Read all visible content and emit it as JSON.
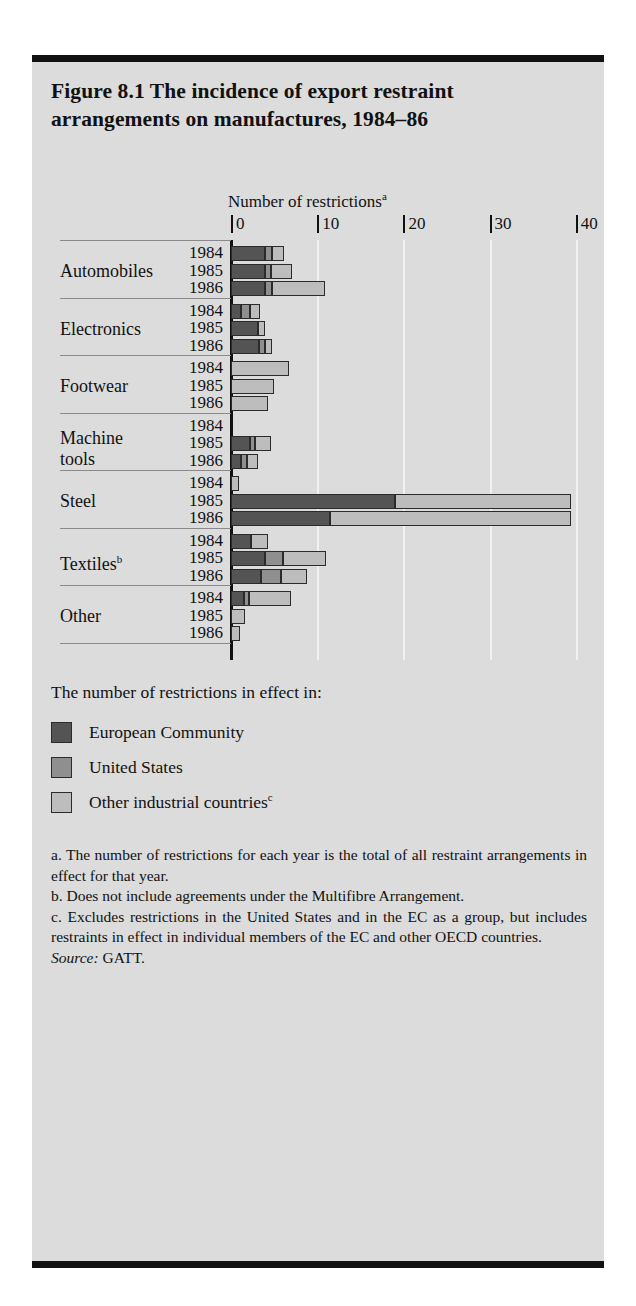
{
  "figure": {
    "title": "Figure 8.1  The incidence of export restraint arrangements on manufactures, 1984–86"
  },
  "chart_data": {
    "type": "bar",
    "orientation": "horizontal",
    "stacked": true,
    "title": "Number of restrictions",
    "title_superscript": "a",
    "xlabel": "Number of restrictions",
    "ylabel": "",
    "xlim": [
      0,
      40
    ],
    "xticks": [
      0,
      10,
      20,
      30,
      40
    ],
    "xticklabels": [
      "0",
      "10",
      "20",
      "30",
      "40"
    ],
    "grid": "vertical",
    "legend_position": "below",
    "series": [
      {
        "name": "European Community",
        "color": "#545454"
      },
      {
        "name": "United States",
        "color": "#8f8f8f"
      },
      {
        "name": "Other industrial countries",
        "color": "#bdbdbd"
      }
    ],
    "categories": [
      "Automobiles",
      "Electronics",
      "Footwear",
      "Machine tools",
      "Steel",
      "Textiles",
      "Other"
    ],
    "years": [
      "1984",
      "1985",
      "1986"
    ],
    "groups": [
      {
        "category": "Automobiles",
        "label": "Automobiles",
        "rows": [
          {
            "year": "1984",
            "values": [
              4.0,
              0.7,
              1.5
            ],
            "total": 6.2
          },
          {
            "year": "1985",
            "values": [
              4.0,
              0.6,
              2.5
            ],
            "total": 7.1
          },
          {
            "year": "1986",
            "values": [
              4.0,
              0.7,
              6.2
            ],
            "total": 10.9
          }
        ]
      },
      {
        "category": "Electronics",
        "label": "Electronics",
        "rows": [
          {
            "year": "1984",
            "values": [
              1.2,
              1.0,
              1.2
            ],
            "total": 3.4
          },
          {
            "year": "1985",
            "values": [
              3.1,
              0.0,
              0.9
            ],
            "total": 4.0
          },
          {
            "year": "1986",
            "values": [
              3.2,
              0.7,
              0.9
            ],
            "total": 4.8
          }
        ]
      },
      {
        "category": "Footwear",
        "label": "Footwear",
        "rows": [
          {
            "year": "1984",
            "values": [
              0.0,
              0.0,
              6.7
            ],
            "total": 6.7
          },
          {
            "year": "1985",
            "values": [
              0.0,
              0.0,
              5.0
            ],
            "total": 5.0
          },
          {
            "year": "1986",
            "values": [
              0.0,
              0.0,
              4.3
            ],
            "total": 4.3
          }
        ]
      },
      {
        "category": "Machine tools",
        "label": "Machine tools",
        "rows": [
          {
            "year": "1984",
            "values": [
              0.0,
              0.0,
              0.0
            ],
            "total": 0.0
          },
          {
            "year": "1985",
            "values": [
              2.2,
              0.6,
              1.8
            ],
            "total": 4.6
          },
          {
            "year": "1986",
            "values": [
              1.2,
              0.7,
              1.2
            ],
            "total": 3.1
          }
        ]
      },
      {
        "category": "Steel",
        "label": "Steel",
        "rows": [
          {
            "year": "1984",
            "values": [
              0.0,
              0.0,
              0.9
            ],
            "total": 0.9
          },
          {
            "year": "1985",
            "values": [
              19.0,
              0.0,
              20.5
            ],
            "total": 39.5
          },
          {
            "year": "1986",
            "values": [
              11.5,
              0.0,
              28.0
            ],
            "total": 39.5
          }
        ]
      },
      {
        "category": "Textiles",
        "label": "Textiles",
        "label_superscript": "b",
        "rows": [
          {
            "year": "1984",
            "values": [
              2.3,
              0.0,
              2.0
            ],
            "total": 4.3
          },
          {
            "year": "1985",
            "values": [
              4.0,
              2.0,
              5.0
            ],
            "total": 11.0
          },
          {
            "year": "1986",
            "values": [
              3.5,
              2.3,
              3.0
            ],
            "total": 8.8
          }
        ]
      },
      {
        "category": "Other",
        "label": "Other",
        "rows": [
          {
            "year": "1984",
            "values": [
              1.5,
              0.6,
              4.9
            ],
            "total": 7.0
          },
          {
            "year": "1985",
            "values": [
              0.0,
              0.0,
              1.6
            ],
            "total": 1.6
          },
          {
            "year": "1986",
            "values": [
              0.0,
              0.0,
              1.0
            ],
            "total": 1.0
          }
        ]
      }
    ]
  },
  "legend": {
    "title": "The number of restrictions in effect in:",
    "items": [
      {
        "label": "European Community",
        "superscript": "",
        "color": "#545454"
      },
      {
        "label": "United States",
        "superscript": "",
        "color": "#8f8f8f"
      },
      {
        "label": "Other industrial countries",
        "superscript": "c",
        "color": "#bdbdbd"
      }
    ]
  },
  "notes": {
    "a": "a. The number of restrictions for each year is the total of all restraint arrangements in effect for that year.",
    "b": "b. Does not include agreements under the Multifibre Arrangement.",
    "c": "c. Excludes restrictions in the United States and in the EC as a group, but includes restraints in effect in individual members of the EC and other OECD countries.",
    "source_label": "Source:",
    "source_value": "GATT."
  }
}
